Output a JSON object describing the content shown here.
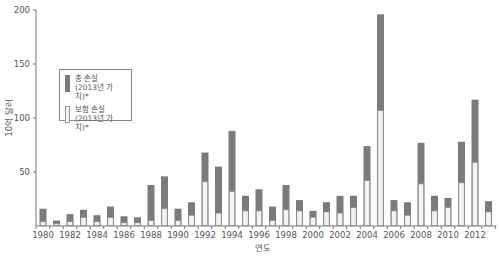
{
  "chart_data": {
    "type": "bar",
    "stacked": "overlay",
    "title": "",
    "xlabel": "연도",
    "ylabel": "10억 달러",
    "ylim": [
      0,
      200
    ],
    "yticks": [
      50,
      100,
      150,
      200
    ],
    "xtick_labels": [
      "1980",
      "1982",
      "1984",
      "1986",
      "1988",
      "1990",
      "1992",
      "1994",
      "1996",
      "1998",
      "2000",
      "2002",
      "2004",
      "2006",
      "2008",
      "2010",
      "2012"
    ],
    "grid": false,
    "legend_position": "upper-left",
    "categories": [
      "1980",
      "1981",
      "1982",
      "1983",
      "1984",
      "1985",
      "1986",
      "1987",
      "1988",
      "1989",
      "1990",
      "1991",
      "1992",
      "1993",
      "1994",
      "1995",
      "1996",
      "1997",
      "1998",
      "1999",
      "2000",
      "2001",
      "2002",
      "2003",
      "2004",
      "2005",
      "2006",
      "2007",
      "2008",
      "2009",
      "2010",
      "2011",
      "2012",
      "2013"
    ],
    "series": [
      {
        "name": "총 손실 (2013년 가치)*",
        "color": "#7b7b7b",
        "values": [
          16,
          5,
          11,
          15,
          10,
          18,
          9,
          8,
          38,
          46,
          16,
          22,
          68,
          55,
          88,
          28,
          34,
          18,
          38,
          24,
          14,
          22,
          28,
          28,
          74,
          196,
          24,
          22,
          77,
          28,
          26,
          78,
          117,
          23
        ]
      },
      {
        "name": "보험 손실 (2013년 가치)*",
        "color": "#f3f3f3",
        "values": [
          4,
          2,
          4,
          8,
          4,
          8,
          3,
          3,
          5,
          16,
          5,
          10,
          41,
          12,
          32,
          14,
          14,
          5,
          15,
          14,
          8,
          13,
          12,
          17,
          42,
          107,
          14,
          10,
          39,
          14,
          17,
          40,
          59,
          13
        ]
      }
    ]
  },
  "legend": {
    "items": [
      {
        "line1": "총 손실",
        "line2": "(2013년 가치)*"
      },
      {
        "line1": "보험 손실",
        "line2": "(2013년 가치)*"
      }
    ]
  }
}
